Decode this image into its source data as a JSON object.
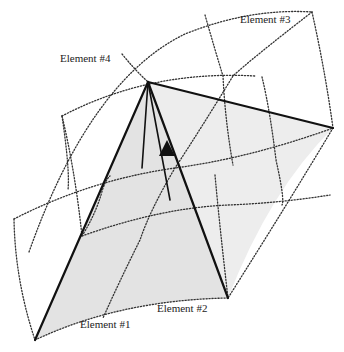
{
  "diagram": {
    "title": "",
    "labels": {
      "element1": "Element #1",
      "element2": "Element #2",
      "element3": "Element #3",
      "element4": "Element #4"
    },
    "colors": {
      "background": "#ffffff",
      "shaded_face": "#e3e3e3",
      "shaded_face_light": "#ededed",
      "solid_edge": "#111111",
      "dotted_grid": "#333333",
      "label_text": "#222222"
    },
    "vertices": {
      "apex": [
        148,
        82
      ],
      "element1_corner": [
        35,
        340
      ],
      "element2_corner": [
        228,
        298
      ],
      "element3_corner": [
        333,
        128
      ],
      "inner_point_a": [
        142,
        168
      ],
      "inner_point_b": [
        170,
        200
      ]
    },
    "icons": {
      "arrow": "up-arrow-triangle"
    }
  }
}
